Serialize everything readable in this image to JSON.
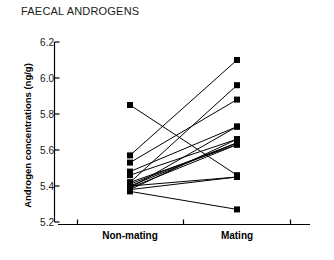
{
  "chart_data": {
    "type": "line",
    "title": "FAECAL ANDROGENS",
    "subtitle": "",
    "xlabel": "",
    "ylabel": "Androgen concentrations (ng/g)",
    "categories": [
      "Non-mating",
      "Mating"
    ],
    "x_tick_labels": [
      "Non-mating",
      "Mating"
    ],
    "y_tick_labels": [
      "5.2",
      "5.4",
      "5.6",
      "5.8",
      "6.0",
      "6.2"
    ],
    "y_ticks": [
      5.2,
      5.4,
      5.6,
      5.8,
      6.0,
      6.2
    ],
    "ylim": [
      5.2,
      6.2
    ],
    "grid": false,
    "legend": false,
    "legend_position": "none",
    "marker": "square",
    "marker_color": "#000000",
    "line_color": "#000000",
    "annotations": [],
    "series": [
      {
        "name": "subject-1",
        "values": [
          5.85,
          5.46
        ]
      },
      {
        "name": "subject-2",
        "values": [
          5.57,
          6.1
        ]
      },
      {
        "name": "subject-3",
        "values": [
          5.53,
          5.88
        ]
      },
      {
        "name": "subject-4",
        "values": [
          5.48,
          5.73
        ]
      },
      {
        "name": "subject-5",
        "values": [
          5.46,
          5.66
        ]
      },
      {
        "name": "subject-6",
        "values": [
          5.42,
          5.63
        ]
      },
      {
        "name": "subject-7",
        "values": [
          5.42,
          5.96
        ]
      },
      {
        "name": "subject-8",
        "values": [
          5.41,
          5.64
        ]
      },
      {
        "name": "subject-9",
        "values": [
          5.4,
          5.64
        ]
      },
      {
        "name": "subject-10",
        "values": [
          5.4,
          5.45
        ]
      },
      {
        "name": "subject-11",
        "values": [
          5.39,
          5.73
        ]
      },
      {
        "name": "subject-12",
        "values": [
          5.39,
          5.63
        ]
      },
      {
        "name": "subject-13",
        "values": [
          5.38,
          5.66
        ]
      },
      {
        "name": "subject-14",
        "values": [
          5.38,
          5.45
        ]
      },
      {
        "name": "subject-15",
        "values": [
          5.37,
          5.27
        ]
      }
    ]
  },
  "layout": {
    "plot_left_x": 130,
    "plot_right_x": 237,
    "axis_start_x": 58,
    "axis_end_x": 310,
    "axis_y": 224,
    "y_top_px": 42,
    "y_bottom_px": 222,
    "x_tick_positions": [
      77,
      183,
      290
    ]
  }
}
